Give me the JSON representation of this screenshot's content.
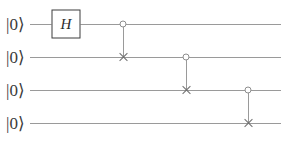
{
  "diagram": {
    "type": "quantum-circuit",
    "title": "",
    "wire_count": 4,
    "qubits": [
      {
        "index": 0,
        "label": "|0⟩",
        "y": 24
      },
      {
        "index": 1,
        "label": "|0⟩",
        "y": 57
      },
      {
        "index": 2,
        "label": "|0⟩",
        "y": 90
      },
      {
        "index": 3,
        "label": "|0⟩",
        "y": 123
      }
    ],
    "wire": {
      "x_start": 30,
      "x_end": 281,
      "color": "#9a9a9a"
    },
    "gates": [
      {
        "id": "hadamard-q0",
        "kind": "box",
        "symbol": "H",
        "qubit": 0,
        "x": 66,
        "width": 29,
        "height": 29,
        "border_color": "#3d3d3d"
      },
      {
        "id": "cnot-q0-q1",
        "kind": "controlled-not",
        "control_qubit": 0,
        "target_qubit": 1,
        "x": 123,
        "control_y": 24,
        "target_y": 57,
        "control_style": "open-circle",
        "target_style": "cross"
      },
      {
        "id": "cnot-q1-q2",
        "kind": "controlled-not",
        "control_qubit": 1,
        "target_qubit": 2,
        "x": 186,
        "control_y": 57,
        "target_y": 90,
        "control_style": "open-circle",
        "target_style": "cross"
      },
      {
        "id": "cnot-q2-q3",
        "kind": "controlled-not",
        "control_qubit": 2,
        "target_qubit": 3,
        "x": 248,
        "control_y": 90,
        "target_y": 123,
        "control_style": "open-circle",
        "target_style": "cross"
      }
    ],
    "colors": {
      "background": "#ffffff",
      "wire": "#9a9a9a",
      "connector": "#9a9a9a",
      "control_stroke": "#8e8e8e",
      "target_stroke": "#6f6f6f",
      "gate_border": "#3d3d3d",
      "text": "#3b3b3b"
    }
  }
}
